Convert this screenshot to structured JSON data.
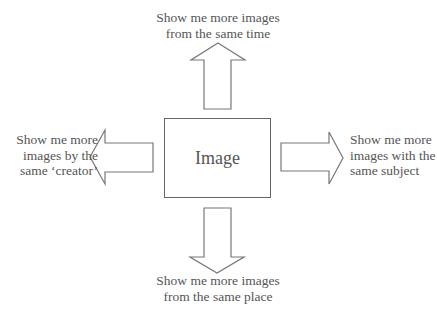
{
  "center": {
    "label": "Image"
  },
  "directions": {
    "up": {
      "lines": [
        "Show me more images",
        "from the same time"
      ]
    },
    "down": {
      "lines": [
        "Show me more images",
        "from the same place"
      ]
    },
    "left": {
      "lines": [
        "Show me more",
        "images by the",
        "same ‘creator’"
      ]
    },
    "right": {
      "lines": [
        "Show me more",
        "images with the",
        "same subject"
      ]
    }
  },
  "colors": {
    "stroke": "#777777",
    "text": "#555555",
    "background": "#ffffff"
  }
}
